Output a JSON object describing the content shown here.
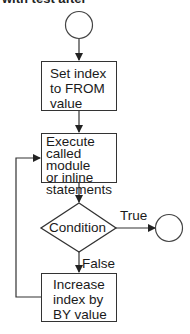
{
  "header": {
    "text": "with test after"
  },
  "flowchart": {
    "nodes": [
      {
        "id": "start",
        "type": "terminator-circle",
        "label": ""
      },
      {
        "id": "init",
        "type": "process",
        "lines": [
          "Set index",
          "to FROM",
          "value"
        ]
      },
      {
        "id": "execute",
        "type": "process",
        "lines": [
          "Execute",
          "called module",
          "or inline",
          "statements"
        ]
      },
      {
        "id": "condition",
        "type": "decision",
        "label": "Condition"
      },
      {
        "id": "increment",
        "type": "process",
        "lines": [
          "Increase",
          "index by",
          "BY value"
        ]
      },
      {
        "id": "end",
        "type": "terminator-circle",
        "label": ""
      }
    ],
    "edges": [
      {
        "from": "start",
        "to": "init",
        "label": ""
      },
      {
        "from": "init",
        "to": "execute",
        "label": ""
      },
      {
        "from": "execute",
        "to": "condition",
        "label": ""
      },
      {
        "from": "condition",
        "to": "end",
        "label": "True"
      },
      {
        "from": "condition",
        "to": "increment",
        "label": "False"
      },
      {
        "from": "increment",
        "to": "execute",
        "label": ""
      }
    ]
  },
  "colors": {
    "line": "#333333",
    "text": "#1a1a1a",
    "background": "#ffffff"
  }
}
